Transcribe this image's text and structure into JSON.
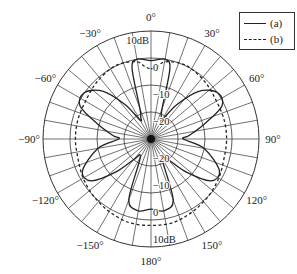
{
  "chart_data": {
    "type": "polar",
    "title": "",
    "angle_unit": "degrees",
    "angle_ticks": [
      0,
      30,
      60,
      90,
      120,
      150,
      180,
      -150,
      -120,
      -90,
      -60,
      -30
    ],
    "angle_tick_labels": {
      "0": "0°",
      "30": "30°",
      "60": "60°",
      "90": "90°",
      "120": "120°",
      "150": "150°",
      "180": "180°",
      "-150": "−150°",
      "-120": "−120°",
      "-90": "−90°",
      "-60": "−60°",
      "-30": "−30°"
    },
    "radial_unit": "dB",
    "radial_range": [
      -30,
      10
    ],
    "radial_rings": [
      -20,
      -10,
      0,
      10
    ],
    "radial_tick_labels_top": [
      "10dB",
      "0",
      "−10",
      "−20"
    ],
    "radial_tick_labels_bottom": [
      "−20",
      "−10",
      "0",
      "10dB"
    ],
    "spoke_step_deg": 10,
    "legend": {
      "position": "top-right",
      "entries": [
        "(a)",
        "(b)"
      ]
    },
    "series": [
      {
        "name": "(a)",
        "style": "solid",
        "angles": [
          0,
          10,
          15,
          20,
          25,
          30,
          37,
          45,
          55,
          65,
          75,
          85,
          90,
          100,
          115,
          125,
          133,
          140,
          150,
          160,
          170,
          180,
          190,
          200,
          210,
          220,
          227,
          235,
          245,
          260,
          270,
          275,
          285,
          295,
          305,
          315,
          323,
          330,
          335,
          340,
          345,
          350
        ],
        "values": [
          -1,
          0,
          -3,
          -18,
          -21,
          -22,
          -14,
          -5,
          0,
          -1,
          -10,
          -16,
          -18,
          -10,
          -2,
          -3,
          -12,
          -20,
          -22,
          -6,
          -3,
          -4,
          -3,
          -6,
          -22,
          -20,
          -12,
          -3,
          -2,
          -10,
          -18,
          -16,
          -10,
          -1,
          0,
          -5,
          -14,
          -22,
          -21,
          -18,
          -3,
          0
        ]
      },
      {
        "name": "(b)",
        "style": "dashed",
        "angles": [
          0,
          5,
          10,
          20,
          30,
          45,
          60,
          75,
          90,
          105,
          120,
          135,
          150,
          165,
          180,
          195,
          210,
          225,
          240,
          255,
          270,
          285,
          300,
          315,
          330,
          340,
          350,
          355
        ],
        "values": [
          -4,
          -3,
          -1,
          0,
          0,
          -1,
          -2,
          -2,
          -2,
          -2,
          -1,
          0,
          1,
          2,
          2,
          2,
          1,
          0,
          -1,
          -2,
          -2,
          -2,
          -2,
          -1,
          0,
          0,
          -1,
          -3
        ]
      }
    ]
  },
  "legend": {
    "entries": [
      {
        "label": "(a)",
        "style": "solid"
      },
      {
        "label": "(b)",
        "style": "dashed"
      }
    ]
  },
  "colors": {
    "line": "#222222",
    "grid": "#333333",
    "background": "#ffffff"
  }
}
